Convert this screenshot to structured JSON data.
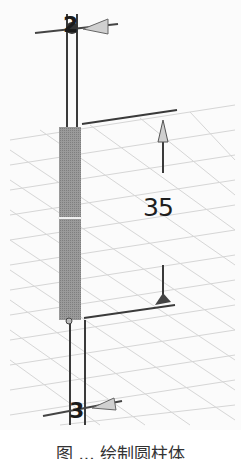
{
  "figure": {
    "dimension": {
      "value": "35"
    },
    "nodes": {
      "top": "2",
      "bottom": "3"
    },
    "caption": "图 ... 绘制圆柱体",
    "colors": {
      "background": "#fbfbfb",
      "grid": "#d4d4d4",
      "cylinder": "#8f8f8f",
      "lines": "#3a3a3a",
      "arrow_fill": "#c8c8c8"
    }
  }
}
